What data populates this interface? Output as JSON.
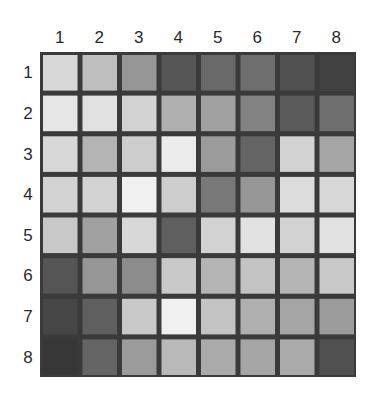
{
  "chart_data": {
    "type": "heatmap",
    "title": "",
    "xlabel": "",
    "ylabel": "",
    "x_categories": [
      "1",
      "2",
      "3",
      "4",
      "5",
      "6",
      "7",
      "8"
    ],
    "y_categories": [
      "1",
      "2",
      "3",
      "4",
      "5",
      "6",
      "7",
      "8"
    ],
    "colormap": "grayscale",
    "value_scale": "gray level 0 (black) to 255 (white)",
    "values": [
      [
        215,
        190,
        150,
        85,
        105,
        110,
        80,
        65
      ],
      [
        230,
        225,
        210,
        175,
        160,
        130,
        90,
        110
      ],
      [
        215,
        180,
        205,
        235,
        155,
        100,
        210,
        165
      ],
      [
        210,
        210,
        240,
        205,
        120,
        150,
        220,
        215
      ],
      [
        200,
        160,
        215,
        95,
        210,
        225,
        210,
        225
      ],
      [
        85,
        150,
        140,
        200,
        180,
        195,
        180,
        200
      ],
      [
        70,
        95,
        200,
        240,
        195,
        175,
        165,
        155
      ],
      [
        55,
        100,
        155,
        185,
        170,
        165,
        170,
        80
      ]
    ],
    "grid_color": "#3a3a3a",
    "x_tick_position": "top",
    "y_tick_position": "left"
  }
}
